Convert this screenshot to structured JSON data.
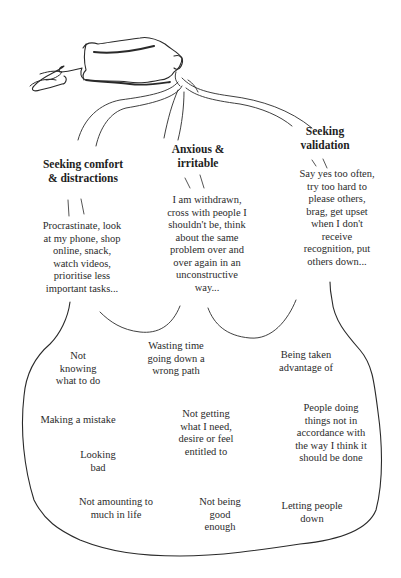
{
  "diagram": {
    "branches": [
      {
        "id": "comfort",
        "heading": [
          "Seeking comfort",
          "& distractions"
        ],
        "behaviours": [
          "Procrastinate, look",
          "at my phone, shop",
          "online, snack,",
          "watch videos,",
          "prioritise less",
          "important tasks..."
        ]
      },
      {
        "id": "anxious",
        "heading": [
          "Anxious &",
          "irritable"
        ],
        "behaviours": [
          "I am withdrawn,",
          "cross with people I",
          "shouldn't be, think",
          "about the same",
          "problem over and",
          "over again in an",
          "unconstructive",
          "way..."
        ]
      },
      {
        "id": "validation",
        "heading": [
          "Seeking",
          "validation"
        ],
        "behaviours": [
          "Say yes too often,",
          "try too hard to",
          "please others,",
          "brag, get upset",
          "when I don't",
          "receive",
          "recognition, put",
          "others down..."
        ]
      }
    ],
    "fears": [
      [
        "Not",
        "knowing",
        "what to do"
      ],
      [
        "Wasting time",
        "going down a",
        "wrong path"
      ],
      [
        "Being taken",
        "advantage of"
      ],
      [
        "Making a mistake"
      ],
      [
        "Not getting",
        "what I need,",
        "desire or feel",
        "entitled to"
      ],
      [
        "People doing",
        "things not in",
        "accordance with",
        "the way I think it",
        "should be done"
      ],
      [
        "Looking",
        "bad"
      ],
      [
        "Not amounting to",
        "much in life"
      ],
      [
        "Not being",
        "good",
        "enough"
      ],
      [
        "Letting people",
        "down"
      ]
    ],
    "colors": {
      "ink": "#2a2a2a",
      "background": "#ffffff"
    }
  }
}
